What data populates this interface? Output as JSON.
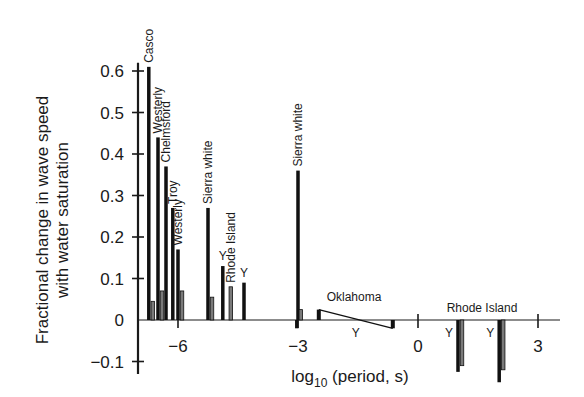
{
  "chart_data": {
    "type": "bar",
    "title": "",
    "xlabel": "log10 (period, s)",
    "xlabel_main": "log",
    "xlabel_sub": "10",
    "xlabel_rest": " (period, s)",
    "ylabel_line1": "Fractional change in wave speed",
    "ylabel_line2": "with water saturation",
    "ylim": [
      -0.1,
      0.6
    ],
    "xlim": [
      -7.0,
      3.5
    ],
    "grid": false,
    "legend": "none",
    "y_ticks": [
      {
        "value": 0.6,
        "label": "0.6"
      },
      {
        "value": 0.5,
        "label": "0.5"
      },
      {
        "value": 0.4,
        "label": "0.4"
      },
      {
        "value": 0.3,
        "label": "0.3"
      },
      {
        "value": 0.2,
        "label": "0.2"
      },
      {
        "value": 0.1,
        "label": "0.1"
      },
      {
        "value": 0,
        "label": "0"
      },
      {
        "value": -0.1,
        "label": "−0.1"
      }
    ],
    "x_ticks": [
      {
        "value": -6,
        "label": "−6"
      },
      {
        "value": -3,
        "label": "−3"
      },
      {
        "value": 0,
        "label": "0"
      },
      {
        "value": 3,
        "label": "3"
      }
    ],
    "bars": [
      {
        "x": -6.73,
        "value": 0.61,
        "shade": "dark",
        "label": "Casco",
        "label_rotated": true
      },
      {
        "x": -6.63,
        "value": 0.045,
        "shade": "gray"
      },
      {
        "x": -6.5,
        "value": 0.44,
        "shade": "dark",
        "label": "Westerly",
        "label_rotated": true
      },
      {
        "x": -6.4,
        "value": 0.07,
        "shade": "gray"
      },
      {
        "x": -6.3,
        "value": 0.37,
        "shade": "dark",
        "label": "Chelmsford",
        "label_rotated": true
      },
      {
        "x": -6.13,
        "value": 0.27,
        "shade": "dark",
        "label": "Troy",
        "label_rotated": true
      },
      {
        "x": -6.0,
        "value": 0.17,
        "shade": "dark",
        "label": "Westerly",
        "label_rotated": true
      },
      {
        "x": -5.9,
        "value": 0.07,
        "shade": "gray"
      },
      {
        "x": -5.25,
        "value": 0.27,
        "shade": "dark",
        "label": "Sierra white",
        "label_rotated": true
      },
      {
        "x": -5.15,
        "value": 0.055,
        "shade": "gray"
      },
      {
        "x": -4.88,
        "value": 0.13,
        "shade": "dark",
        "label": "Y",
        "label_rotated": false
      },
      {
        "x": -4.68,
        "value": 0.08,
        "shade": "gray",
        "label": "Rhode Island",
        "label_rotated": true
      },
      {
        "x": -4.35,
        "value": 0.09,
        "shade": "dark",
        "label": "Y",
        "label_rotated": false
      },
      {
        "x": -3.0,
        "value": 0.36,
        "shade": "dark",
        "label": "Sierra white",
        "label_rotated": true
      },
      {
        "x": -2.93,
        "value": 0.025,
        "shade": "gray"
      },
      {
        "x": -3.03,
        "value": -0.02,
        "shade": "dark"
      },
      {
        "x": 1.0,
        "value": -0.125,
        "shade": "dark",
        "label": "Y",
        "label_rotated": false
      },
      {
        "x": 1.1,
        "value": -0.11,
        "shade": "gray"
      },
      {
        "x": 2.03,
        "value": -0.15,
        "shade": "dark",
        "label": "Y",
        "label_rotated": false
      },
      {
        "x": 2.13,
        "value": -0.12,
        "shade": "gray"
      }
    ],
    "ramp": {
      "name": "Oklahoma",
      "x_start": -2.48,
      "y_start": 0.025,
      "x_end": -0.63,
      "y_end": -0.02,
      "y_label": "Y"
    },
    "group_labels": [
      {
        "text": "Oklahoma",
        "x": -1.6,
        "y": 0.045
      },
      {
        "text": "Rhode Island",
        "x": 1.6,
        "y": 0.02
      }
    ]
  }
}
